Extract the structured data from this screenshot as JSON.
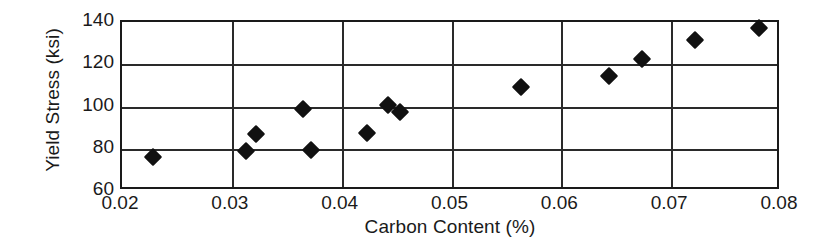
{
  "chart_data": {
    "type": "scatter",
    "title": "",
    "xlabel": "Carbon Content (%)",
    "ylabel": "Yield Stress (ksi)",
    "xlim": [
      0.02,
      0.08
    ],
    "ylim": [
      60,
      140
    ],
    "xticks": [
      0.02,
      0.03,
      0.04,
      0.05,
      0.06,
      0.07,
      0.08
    ],
    "xtick_labels": [
      "0.02",
      "0.03",
      "0.04",
      "0.05",
      "0.06",
      "0.07",
      "0.08"
    ],
    "yticks": [
      60,
      80,
      100,
      120,
      140
    ],
    "ytick_labels": [
      "60",
      "80",
      "100",
      "120",
      "140"
    ],
    "grid": true,
    "grid_axes": "both",
    "legend": "none",
    "marker": "diamond",
    "marker_color": "#111111",
    "points": [
      {
        "x": 0.0228,
        "y": 76.0
      },
      {
        "x": 0.0313,
        "y": 79.0
      },
      {
        "x": 0.0322,
        "y": 87.0
      },
      {
        "x": 0.0365,
        "y": 99.0
      },
      {
        "x": 0.0372,
        "y": 79.5
      },
      {
        "x": 0.0423,
        "y": 87.5
      },
      {
        "x": 0.0442,
        "y": 100.5
      },
      {
        "x": 0.0453,
        "y": 97.5
      },
      {
        "x": 0.0563,
        "y": 109.0
      },
      {
        "x": 0.0643,
        "y": 114.5
      },
      {
        "x": 0.0673,
        "y": 122.5
      },
      {
        "x": 0.0722,
        "y": 131.5
      },
      {
        "x": 0.078,
        "y": 137.0
      }
    ]
  }
}
